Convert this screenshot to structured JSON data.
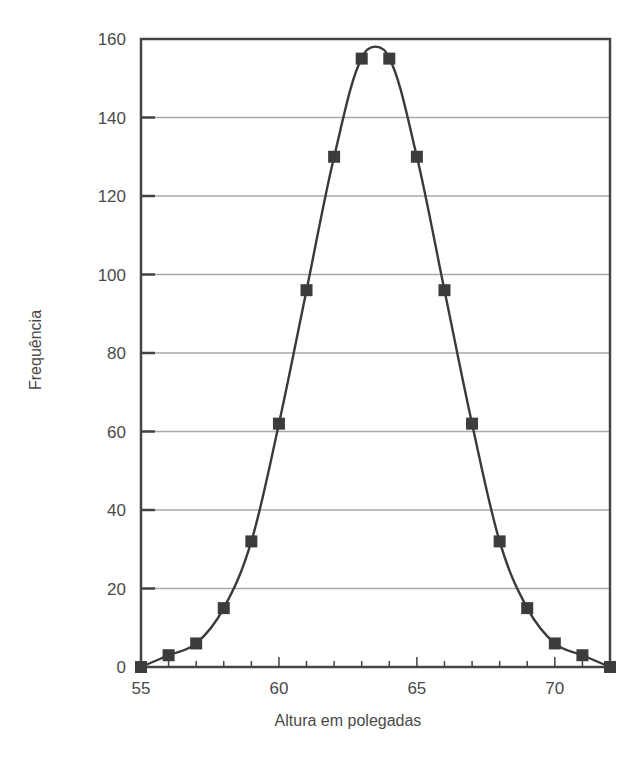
{
  "chart_data": {
    "type": "line",
    "title": "",
    "xlabel": "Altura em polegadas",
    "ylabel": "Frequência",
    "x": [
      55,
      56,
      57,
      58,
      59,
      60,
      61,
      62,
      63,
      64,
      65,
      66,
      67,
      68,
      69,
      70,
      71,
      72
    ],
    "series": [
      {
        "name": "Frequência",
        "values": [
          0,
          3,
          6,
          15,
          32,
          62,
          96,
          130,
          155,
          155,
          130,
          96,
          62,
          32,
          15,
          6,
          3,
          0
        ],
        "marker": "square",
        "smooth": true
      }
    ],
    "xlim": [
      55,
      72
    ],
    "ylim": [
      0,
      160
    ],
    "x_ticks": [
      55,
      60,
      65,
      70
    ],
    "x_tick_labels": [
      "55",
      "60",
      "65",
      "70"
    ],
    "x_minor_ticks": [
      56,
      57,
      58,
      59,
      61,
      62,
      63,
      64,
      66,
      67,
      68,
      69,
      71
    ],
    "y_ticks": [
      0,
      20,
      40,
      60,
      80,
      100,
      120,
      140,
      160
    ],
    "y_tick_labels": [
      "0",
      "20",
      "40",
      "60",
      "80",
      "100",
      "120",
      "140",
      "160"
    ],
    "grid": {
      "horizontal": true,
      "vertical": false
    },
    "legend": null
  },
  "colors": {
    "line": "#3a3a3a",
    "marker": "#3c3c3c",
    "frame": "#444444",
    "grid": "#a8a8a8",
    "text": "#4a4a4a"
  }
}
